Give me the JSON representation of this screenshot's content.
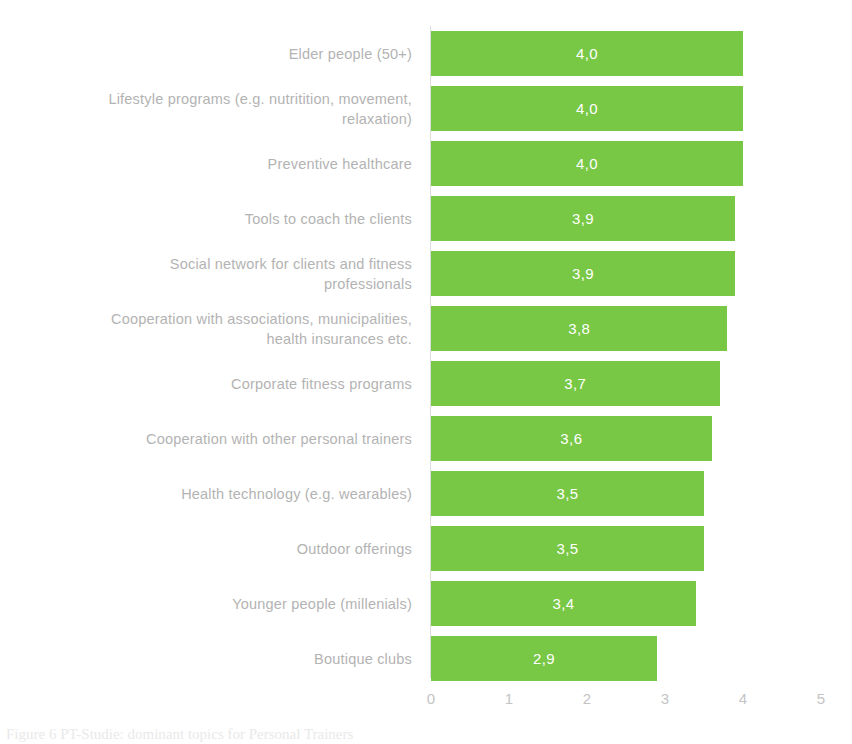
{
  "chart_data": {
    "type": "bar",
    "orientation": "horizontal",
    "title": "",
    "subtitle": "",
    "xlabel": "",
    "ylabel": "",
    "xlim": [
      0,
      5
    ],
    "x_ticks": [
      "0",
      "1",
      "2",
      "3",
      "4",
      "5"
    ],
    "grid": false,
    "legend": null,
    "decimal_separator": ",",
    "bar_color": "#78c846",
    "label_color": "#b3b3b3",
    "value_label_color": "#ffffff",
    "axis_tick_color": "#c4c4c4",
    "categories": [
      "Elder people (50+)",
      "Lifestyle programs (e.g. nutritition, movement,\nrelaxation)",
      "Preventive healthcare",
      "Tools to coach the clients",
      "Social network for clients and fitness\nprofessionals",
      "Cooperation with associations, municipalities,\nhealth insurances etc.",
      "Corporate fitness programs",
      "Cooperation with other personal trainers",
      "Health technology (e.g. wearables)",
      "Outdoor offerings",
      "Younger people (millenials)",
      "Boutique clubs"
    ],
    "values": [
      4.0,
      4.0,
      4.0,
      3.9,
      3.9,
      3.8,
      3.7,
      3.6,
      3.5,
      3.5,
      3.4,
      2.9
    ],
    "value_labels": [
      "4,0",
      "4,0",
      "4,0",
      "3,9",
      "3,9",
      "3,8",
      "3,7",
      "3,6",
      "3,5",
      "3,5",
      "3,4",
      "2,9"
    ]
  },
  "caption": {
    "text": "Figure 6 PT-Studie: dominant topics for Personal Trainers"
  }
}
